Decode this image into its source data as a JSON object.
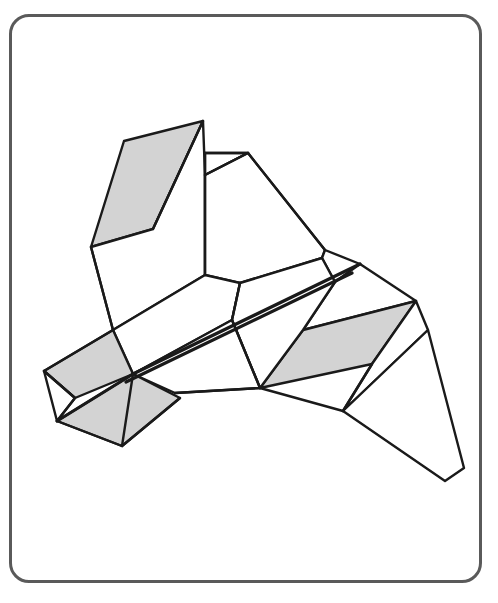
{
  "page": {
    "width": 498,
    "height": 603,
    "background_color": "#ffffff"
  },
  "card": {
    "name": "rounded-card-frame",
    "border_color": "#5a5a5a",
    "border_width": 3,
    "corner_radius": 20,
    "x": 9,
    "y": 14,
    "width": 473,
    "height": 569,
    "fill_color": "#ffffff"
  },
  "figure": {
    "line_color": "#1a1a1a",
    "shaded_fill": "#d3d3d3",
    "plain_fill": "#ffffff",
    "stroke_width": 2.4,
    "spine_stroke_width": 3.2,
    "faces": [
      {
        "id": "upper-left-wing-shaded",
        "shading": "shaded",
        "points": "203,121 124,141 91,247 153,229"
      },
      {
        "id": "upper-left-wing-under",
        "shading": "plain",
        "points": "203,121 153,229 91,247 113,330 205,275 205,175"
      },
      {
        "id": "upper-center-ridge-face",
        "shading": "plain",
        "points": "205,153 248,153 205,175"
      },
      {
        "id": "upper-right-body-face",
        "shading": "plain",
        "points": "248,153 325,250 322,258 240,283 205,275 205,175"
      },
      {
        "id": "center-body-panel",
        "shading": "plain",
        "points": "205,275 240,283 232,320 133,374 113,330"
      },
      {
        "id": "right-upper-spine-strip",
        "shading": "plain",
        "points": "325,250 360,264 335,282 322,258"
      },
      {
        "id": "right-wing-top-panel",
        "shading": "plain",
        "points": "335,282 360,264 416,301 303,330"
      },
      {
        "id": "right-wing-shaded",
        "shading": "shaded",
        "points": "416,301 303,330 260,388 372,364"
      },
      {
        "id": "right-wing-under-panel",
        "shading": "plain",
        "points": "322,258 335,282 303,330 260,388 232,320 240,283"
      },
      {
        "id": "tail-upper-panel",
        "shading": "plain",
        "points": "416,301 372,364 343,411 428,330"
      },
      {
        "id": "tail-fin",
        "shading": "plain",
        "points": "428,330 343,411 445,481 464,468"
      },
      {
        "id": "lower-body-panel",
        "shading": "plain",
        "points": "133,374 232,320 260,388 175,393"
      },
      {
        "id": "nose-upper-shaded",
        "shading": "shaded",
        "points": "113,330 133,374 75,398 44,371"
      },
      {
        "id": "nose-lower-shaded",
        "shading": "shaded",
        "points": "133,374 180,398 122,446 57,421"
      },
      {
        "id": "nose-tip-plain",
        "shading": "plain",
        "points": "44,371 75,398 57,421"
      }
    ],
    "fold_lines": [
      {
        "id": "spine-upper",
        "points": "360,264 133,374"
      },
      {
        "id": "spine-lower",
        "points": "352,273 126,382"
      },
      {
        "id": "nose-spine",
        "points": "133,374 57,421"
      },
      {
        "id": "center-vertical",
        "points": "205,153 205,275"
      },
      {
        "id": "ridge-diagonal",
        "points": "205,175 248,153"
      },
      {
        "id": "ridge-horizontal",
        "points": "205,153 248,153"
      },
      {
        "id": "body-right-edge",
        "points": "248,153 325,250"
      },
      {
        "id": "body-lower-fold",
        "points": "240,283 232,320"
      },
      {
        "id": "wing-lower-fold",
        "points": "232,320 260,388"
      },
      {
        "id": "bottom-horizontal",
        "points": "175,393 260,388"
      },
      {
        "id": "tail-lower-edge",
        "points": "260,388 343,411"
      },
      {
        "id": "tail-crease",
        "points": "372,364 343,411"
      },
      {
        "id": "nose-left-edge",
        "points": "44,371 113,330"
      },
      {
        "id": "nose-under-edge",
        "points": "44,371 75,398 57,421"
      },
      {
        "id": "nose-bottom-edge",
        "points": "57,421 122,446 180,398"
      },
      {
        "id": "nose-fold-vertical",
        "points": "122,446 133,374"
      },
      {
        "id": "left-body-edge",
        "points": "91,247 113,330"
      },
      {
        "id": "wing-notch-fold",
        "points": "153,229 203,121"
      }
    ]
  }
}
